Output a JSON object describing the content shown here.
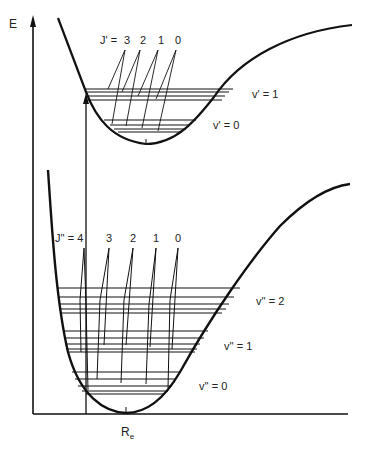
{
  "diagram": {
    "axis": {
      "y_label": "E",
      "x_label_main": "R",
      "x_label_sub": "e"
    },
    "upper_state": {
      "j_label": "J' =",
      "j_values": [
        "3",
        "2",
        "1",
        "0"
      ],
      "vib_levels": [
        "v' = 1",
        "v' = 0"
      ]
    },
    "lower_state": {
      "j_label": "J'' = 4",
      "j_values": [
        "3",
        "2",
        "1",
        "0"
      ],
      "vib_levels": [
        "v'' = 2",
        "v'' = 1",
        "v'' = 0"
      ]
    }
  }
}
